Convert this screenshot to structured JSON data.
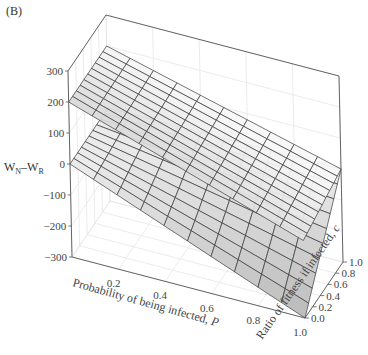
{
  "panel_label": "(B)",
  "chart_data": {
    "type": "surface3d",
    "title": "",
    "panel": "(B)",
    "zlabel": "W_N–W_R",
    "zlabel_parts": {
      "main1": "W",
      "sub1": "N",
      "dash": "–",
      "main2": "W",
      "sub2": "R"
    },
    "xlabel": "Probability of being infected, P",
    "xlabel_text": "Probability of being infected, ",
    "xlabel_var": "P",
    "ylabel": "Ratio of fitness if infected, c",
    "ylabel_text": "Ratio of fitness if infected, ",
    "ylabel_var": "c",
    "zlim": [
      -300,
      300
    ],
    "xlim": [
      0.0,
      1.0
    ],
    "ylim": [
      0.0,
      1.0
    ],
    "z_ticks": [
      "300",
      "200",
      "100",
      "0",
      "−100",
      "−200",
      "−300"
    ],
    "x_ticks": [
      "0.2",
      "0.4",
      "0.6",
      "0.8",
      "1.0"
    ],
    "y_ticks": [
      "0.0",
      "0.2",
      "0.4",
      "0.6",
      "0.8",
      "1.0"
    ],
    "grid": true,
    "surfaces": [
      {
        "name": "upper plane",
        "description": "Nearly flat plane tilted from ~200 at front-left corner to ~0 near far-right corner",
        "corner_values": {
          "P0_c0": 200,
          "P0_c1": 200,
          "P1_c0": -50,
          "P1_c1": 0
        }
      },
      {
        "name": "folded surface",
        "description": "Surface starting at 0 along P=0 edge, dropping to minimum near P=1, c=0 (about -300) and rising to ~0 at c=1",
        "corner_values": {
          "P0_c0": 0,
          "P0_c1": 0,
          "P1_c0": -300,
          "P1_c1": 0
        }
      }
    ],
    "mesh_resolution": 10
  }
}
